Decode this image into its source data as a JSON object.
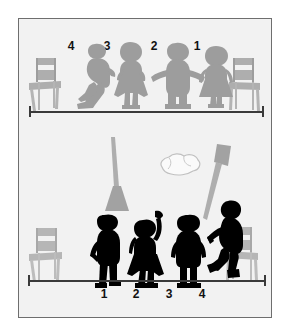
{
  "illustration": {
    "title": "Two-row line-up comparison illustration",
    "background_color": "#f2f2f2",
    "frame_color": "#6e6e6e",
    "gray_ink": "#a6a6a6",
    "gray_ink_dark": "#9a9a9a",
    "black_ink": "#000000",
    "rule_color": "#3a3a3a"
  },
  "top_scene": {
    "name": "top-row-scene",
    "ink": "gray",
    "description": "Four gray silhouette children standing in a row between two chairs, numbered right to left",
    "labels": [
      "4",
      "3",
      "2",
      "1"
    ],
    "figures": [
      {
        "label": "4",
        "pose": "walking-left",
        "type": "boy"
      },
      {
        "label": "3",
        "pose": "hands-on-hips",
        "type": "girl"
      },
      {
        "label": "2",
        "pose": "arms-out",
        "type": "boy"
      },
      {
        "label": "1",
        "pose": "standing",
        "type": "girl"
      }
    ],
    "chairs": [
      {
        "name": "chair-left",
        "side": "left"
      },
      {
        "name": "chair-right",
        "side": "right"
      }
    ],
    "rule": {
      "name": "measurement-rule-top",
      "caps": 2
    }
  },
  "middle_scene": {
    "name": "props-scene",
    "props": [
      {
        "name": "broom-left",
        "label": "broom",
        "orientation": "handle-up-head-down"
      },
      {
        "name": "crumpled-paper",
        "label": "crumpled paper",
        "orientation": "center"
      },
      {
        "name": "broom-right",
        "label": "broom",
        "orientation": "head-up-handle-down"
      }
    ]
  },
  "bottom_scene": {
    "name": "bottom-row-scene",
    "ink": "black",
    "description": "Four black silhouette children standing in a row between two chairs, numbered left to right",
    "labels": [
      "1",
      "2",
      "3",
      "4"
    ],
    "figures": [
      {
        "label": "1",
        "pose": "hand-on-hip",
        "type": "boy"
      },
      {
        "label": "2",
        "pose": "arm-raised",
        "type": "girl"
      },
      {
        "label": "3",
        "pose": "standing",
        "type": "boy"
      },
      {
        "label": "4",
        "pose": "walking-right",
        "type": "boy"
      }
    ],
    "chairs": [
      {
        "name": "chair-left",
        "side": "left"
      },
      {
        "name": "chair-right",
        "side": "right"
      }
    ],
    "rule": {
      "name": "measurement-rule-bottom",
      "caps": 2
    }
  }
}
